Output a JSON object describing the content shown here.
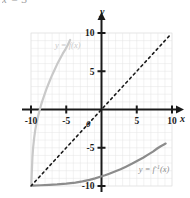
{
  "top_cut_text": "x = 3",
  "axes": {
    "x_name": "x",
    "y_name": "y",
    "origin_label": "0"
  },
  "labels": {
    "f_curve": "y = f(x)",
    "finv_curve_prefix": "y = f",
    "finv_curve_exp": "-1",
    "finv_curve_suffix": "(x)"
  },
  "ticks": {
    "x": [
      "-10",
      "-5",
      "5",
      "10"
    ],
    "y": [
      "10",
      "5",
      "-5",
      "-10"
    ]
  },
  "chart_data": {
    "type": "line",
    "title": "",
    "xlabel": "x",
    "ylabel": "y",
    "xlim": [
      -10,
      10
    ],
    "ylim": [
      -10,
      10
    ],
    "grid": true,
    "grid_step": 1,
    "tick_step": 5,
    "legend": "inline-annotations",
    "series": [
      {
        "name": "y = f(x)",
        "color": "#c9c9c9",
        "style": "solid",
        "label_x": -6.6,
        "label_y": 8.1,
        "points": [
          [
            -9.95,
            -9.8
          ],
          [
            -9.9,
            -8.6
          ],
          [
            -9.85,
            -7.4
          ],
          [
            -9.8,
            -6.3
          ],
          [
            -9.7,
            -5.0
          ],
          [
            -9.55,
            -3.7
          ],
          [
            -9.4,
            -2.7
          ],
          [
            -9.2,
            -1.7
          ],
          [
            -9.0,
            -0.9
          ],
          [
            -8.8,
            -0.2
          ],
          [
            -8.6,
            0.5
          ],
          [
            -8.4,
            1.1
          ],
          [
            -8.1,
            1.9
          ],
          [
            -7.8,
            2.7
          ],
          [
            -7.5,
            3.4
          ],
          [
            -7.1,
            4.3
          ],
          [
            -6.7,
            5.1
          ],
          [
            -6.3,
            5.9
          ],
          [
            -5.9,
            6.6
          ],
          [
            -5.5,
            7.3
          ],
          [
            -5.1,
            7.9
          ],
          [
            -4.8,
            8.4
          ],
          [
            -4.6,
            8.8
          ],
          [
            -4.45,
            9.1
          ]
        ]
      },
      {
        "name": "y = f^-1(x)",
        "color": "#8c8c8c",
        "style": "solid",
        "label_x": 5.3,
        "label_y": -8.2,
        "points": [
          [
            -9.8,
            -9.95
          ],
          [
            -8.6,
            -9.9
          ],
          [
            -7.4,
            -9.85
          ],
          [
            -6.3,
            -9.8
          ],
          [
            -5.0,
            -9.7
          ],
          [
            -3.7,
            -9.55
          ],
          [
            -2.7,
            -9.4
          ],
          [
            -1.7,
            -9.2
          ],
          [
            -0.9,
            -9.0
          ],
          [
            -0.2,
            -8.8
          ],
          [
            0.5,
            -8.6
          ],
          [
            1.1,
            -8.4
          ],
          [
            1.9,
            -8.1
          ],
          [
            2.7,
            -7.8
          ],
          [
            3.4,
            -7.5
          ],
          [
            4.3,
            -7.1
          ],
          [
            5.1,
            -6.7
          ],
          [
            5.9,
            -6.3
          ],
          [
            6.6,
            -5.9
          ],
          [
            7.3,
            -5.5
          ],
          [
            7.9,
            -5.1
          ],
          [
            8.4,
            -4.8
          ],
          [
            8.8,
            -4.6
          ],
          [
            9.1,
            -4.45
          ]
        ]
      },
      {
        "name": "y = x",
        "color": "#1a1a1a",
        "style": "dashed",
        "points": [
          [
            -10,
            -10
          ],
          [
            9.6,
            9.6
          ]
        ]
      }
    ]
  },
  "colors": {
    "grid": "#e4e4e4",
    "axis": "#1a1a1a",
    "f_curve": "#c9c9c9",
    "finv_curve": "#8c8c8c",
    "identity_line": "#1a1a1a",
    "background": "#ffffff"
  }
}
